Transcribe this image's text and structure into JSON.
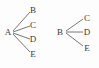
{
  "figure": {
    "background_color": "#fdfdfd",
    "stroke_color": "#555555",
    "text_color": "#3a3a3a",
    "diagrams": [
      {
        "name": "left-tree",
        "root": "A",
        "leaves": [
          "B",
          "C",
          "D",
          "E"
        ],
        "edges": [
          {
            "from": "A",
            "to": "B"
          },
          {
            "from": "A",
            "to": "C"
          },
          {
            "from": "A",
            "to": "D"
          },
          {
            "from": "A",
            "to": "E"
          }
        ],
        "nodes": [
          {
            "id": "A",
            "label": "A",
            "x": 8,
            "y": 32
          },
          {
            "id": "B",
            "label": "B",
            "x": 33,
            "y": 10
          },
          {
            "id": "C",
            "label": "C",
            "x": 33,
            "y": 25
          },
          {
            "id": "D",
            "label": "D",
            "x": 33,
            "y": 39
          },
          {
            "id": "E",
            "label": "E",
            "x": 33,
            "y": 54
          }
        ],
        "edge_lines": [
          {
            "x1": 13,
            "y1": 31,
            "x2": 30,
            "y2": 12
          },
          {
            "x1": 13,
            "y1": 32,
            "x2": 30,
            "y2": 26
          },
          {
            "x1": 13,
            "y1": 33,
            "x2": 30,
            "y2": 39
          },
          {
            "x1": 13,
            "y1": 34,
            "x2": 30,
            "y2": 52
          }
        ]
      },
      {
        "name": "right-tree",
        "root": "B",
        "leaves": [
          "C",
          "D",
          "E"
        ],
        "edges": [
          {
            "from": "B",
            "to": "C"
          },
          {
            "from": "B",
            "to": "D"
          },
          {
            "from": "B",
            "to": "E"
          }
        ],
        "nodes": [
          {
            "id": "B",
            "label": "B",
            "x": 60,
            "y": 32
          },
          {
            "id": "C",
            "label": "C",
            "x": 87,
            "y": 18
          },
          {
            "id": "D",
            "label": "D",
            "x": 87,
            "y": 32
          },
          {
            "id": "E",
            "label": "E",
            "x": 87,
            "y": 48
          }
        ],
        "edge_lines": [
          {
            "x1": 66,
            "y1": 31,
            "x2": 83,
            "y2": 19
          },
          {
            "x1": 66,
            "y1": 32,
            "x2": 83,
            "y2": 32
          },
          {
            "x1": 66,
            "y1": 33,
            "x2": 83,
            "y2": 46
          }
        ]
      }
    ]
  }
}
